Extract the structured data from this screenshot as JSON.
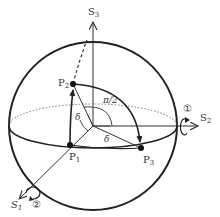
{
  "diagram": {
    "axes": {
      "s1": {
        "label": "S",
        "sub": "1"
      },
      "s2": {
        "label": "S",
        "sub": "2"
      },
      "s3": {
        "label": "S",
        "sub": "3"
      }
    },
    "points": {
      "p1": {
        "label": "P",
        "sub": "1"
      },
      "p2": {
        "label": "P",
        "sub": "2"
      },
      "p3": {
        "label": "P",
        "sub": "3"
      }
    },
    "angles": {
      "delta_vertical": "δ",
      "delta_horizontal": "δ",
      "right_angle": "π/2"
    },
    "rotation_markers": {
      "about_s2": "①",
      "about_s1": "②"
    },
    "colors": {
      "line": "#222222",
      "text": "#333333",
      "dotted": "#555555"
    }
  }
}
